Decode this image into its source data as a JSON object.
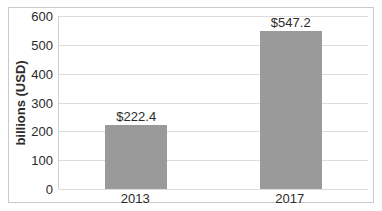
{
  "chart_data": {
    "type": "bar",
    "categories": [
      "2013",
      "2017"
    ],
    "values": [
      222.4,
      547.2
    ],
    "value_labels": [
      "$222.4",
      "$547.2"
    ],
    "title": "",
    "xlabel": "",
    "ylabel": "billions (USD)",
    "ylim": [
      0,
      600
    ],
    "yticks": [
      0,
      100,
      200,
      300,
      400,
      500,
      600
    ],
    "grid": "horizontal",
    "legend": "none",
    "bar_color": "#9a9a9a",
    "bar_width_px": 62,
    "gridline_color": "#dcdcdc",
    "axis_color": "#cfcfcf",
    "text_color": "#2b2b2b",
    "frame_border_color": "#c9c9c9",
    "background_color": "#ffffff"
  }
}
